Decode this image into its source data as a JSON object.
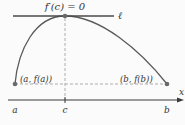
{
  "diagram": {
    "title_label": "f′(c) = 0",
    "tangent_label": "ℓ",
    "axis_label": "x",
    "point_a_label": "(a, f(a))",
    "point_b_label": "(b, f(b))",
    "tick_a": "a",
    "tick_c": "c",
    "tick_b": "b",
    "colors": {
      "curve": "#5a5a5a",
      "tangent": "#4a4a4a",
      "dashed": "#9a9a9a",
      "axis": "#3a3a3a",
      "point": "#6a6a6a"
    }
  }
}
